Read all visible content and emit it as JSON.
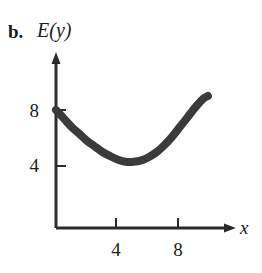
{
  "figure": {
    "part_label": "b.",
    "y_axis_title": "E(y)",
    "x_axis_title": "x",
    "ink_color": "#2b2b2b",
    "curve_color": "#3b3b3b",
    "background_color": "#ffffff"
  },
  "chart_data": {
    "type": "line",
    "title": "",
    "subtitle": "",
    "xlabel": "x",
    "ylabel": "E(y)",
    "xlim": [
      0,
      11
    ],
    "ylim": [
      0,
      11.5
    ],
    "grid": false,
    "legend": null,
    "axis_arrows": true,
    "xticks": [
      4,
      8
    ],
    "xtick_labels": [
      "4",
      "8"
    ],
    "yticks": [
      4,
      8
    ],
    "ytick_labels": [
      "8",
      "4"
    ],
    "series": [
      {
        "name": "E(y)",
        "description": "U-shaped (convex) curve starting at (0, 8), minimum near (4.2, 4.3), rising to (9.8, 9)",
        "x": [
          0.0,
          0.5,
          1.0,
          1.5,
          2.0,
          2.5,
          3.0,
          3.5,
          4.0,
          4.5,
          5.0,
          5.5,
          6.0,
          6.5,
          7.0,
          7.5,
          8.0,
          8.5,
          9.0,
          9.5,
          9.8
        ],
        "y": [
          8.0,
          7.4,
          6.8,
          6.3,
          5.8,
          5.4,
          5.0,
          4.7,
          4.45,
          4.3,
          4.3,
          4.4,
          4.65,
          5.0,
          5.5,
          6.1,
          6.8,
          7.5,
          8.2,
          8.8,
          9.0
        ]
      }
    ],
    "annotations": []
  },
  "y_tick_values": {
    "upper": "8",
    "lower": "4"
  },
  "x_tick_values": {
    "first": "4",
    "second": "8"
  }
}
